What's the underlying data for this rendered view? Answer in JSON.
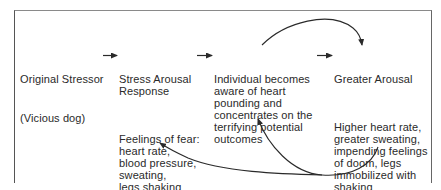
{
  "diagram": {
    "nodes": [
      {
        "id": "original-stressor",
        "title": "Original Stressor",
        "subtitle": "(Vicious dog)"
      },
      {
        "id": "stress-arousal",
        "title": "Stress Arousal\nResponse",
        "description": "Feelings of fear:\nheart rate,\nblood pressure,\nsweating,\nlegs shaking"
      },
      {
        "id": "individual-aware",
        "title": "Individual becomes\naware of heart\npounding and\nconcentrates on the\nterrifying potential\noutcomes"
      },
      {
        "id": "greater-arousal",
        "title": "Greater Arousal",
        "description": "Higher heart rate,\ngreater sweating,\nimpending feelings\nof doom, legs\nimmobilized with\nshaking"
      }
    ],
    "edges": [
      {
        "from": "original-stressor",
        "to": "stress-arousal",
        "style": "straight"
      },
      {
        "from": "stress-arousal",
        "to": "individual-aware",
        "style": "straight"
      },
      {
        "from": "individual-aware",
        "to": "greater-arousal",
        "style": "straight"
      },
      {
        "from": "individual-aware",
        "to": "greater-arousal",
        "style": "curved-top"
      },
      {
        "from": "greater-arousal",
        "to": "individual-aware",
        "style": "curved-bottom"
      },
      {
        "from": "greater-arousal",
        "to": "stress-arousal",
        "style": "curved-bottom"
      }
    ],
    "colors": {
      "line": "#2a2a2a",
      "frame": "#666666",
      "background": "#ffffff"
    }
  }
}
